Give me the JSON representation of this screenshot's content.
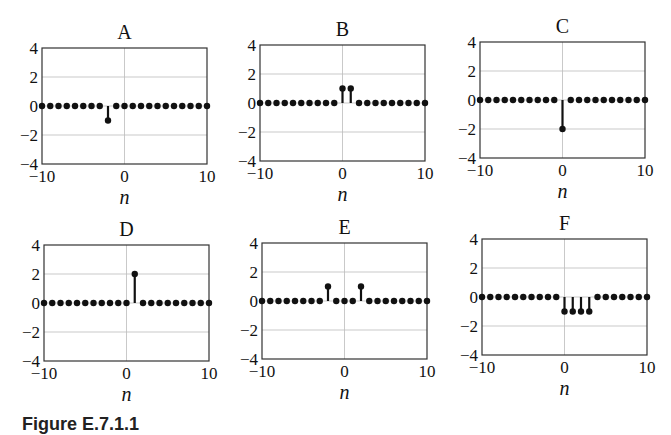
{
  "figure": {
    "caption": "Figure E.7.1.1"
  },
  "axes_common": {
    "xlim": [
      -10,
      10
    ],
    "ylim": [
      -4,
      4
    ],
    "xticks": [
      -10,
      0,
      10
    ],
    "xtick_labels": [
      "−10",
      "0",
      "10"
    ],
    "yticks": [
      4,
      2,
      0,
      -2,
      -4
    ],
    "ytick_labels": [
      "4",
      "2",
      "0",
      "−2",
      "−4"
    ],
    "xlabel": "n",
    "grid": true,
    "marker_color": "#111111",
    "grid_color": "#bbbbbb"
  },
  "chart_data": [
    {
      "type": "stem",
      "title": "A",
      "xlabel": "n",
      "ylabel": "",
      "xlim": [
        -10,
        10
      ],
      "ylim": [
        -4,
        4
      ],
      "grid": true,
      "x": [
        -10,
        -9,
        -8,
        -7,
        -6,
        -5,
        -4,
        -3,
        -2,
        -1,
        0,
        1,
        2,
        3,
        4,
        5,
        6,
        7,
        8,
        9,
        10
      ],
      "values": [
        0,
        0,
        0,
        0,
        0,
        0,
        0,
        0,
        -1,
        0,
        0,
        0,
        0,
        0,
        0,
        0,
        0,
        0,
        0,
        0,
        0
      ]
    },
    {
      "type": "stem",
      "title": "B",
      "xlabel": "n",
      "ylabel": "",
      "xlim": [
        -10,
        10
      ],
      "ylim": [
        -4,
        4
      ],
      "grid": true,
      "x": [
        -10,
        -9,
        -8,
        -7,
        -6,
        -5,
        -4,
        -3,
        -2,
        -1,
        0,
        1,
        2,
        3,
        4,
        5,
        6,
        7,
        8,
        9,
        10
      ],
      "values": [
        0,
        0,
        0,
        0,
        0,
        0,
        0,
        0,
        0,
        0,
        1,
        1,
        0,
        0,
        0,
        0,
        0,
        0,
        0,
        0,
        0
      ]
    },
    {
      "type": "stem",
      "title": "C",
      "xlabel": "n",
      "ylabel": "",
      "xlim": [
        -10,
        10
      ],
      "ylim": [
        -4,
        4
      ],
      "grid": true,
      "x": [
        -10,
        -9,
        -8,
        -7,
        -6,
        -5,
        -4,
        -3,
        -2,
        -1,
        0,
        1,
        2,
        3,
        4,
        5,
        6,
        7,
        8,
        9,
        10
      ],
      "values": [
        0,
        0,
        0,
        0,
        0,
        0,
        0,
        0,
        0,
        0,
        -2,
        0,
        0,
        0,
        0,
        0,
        0,
        0,
        0,
        0,
        0
      ]
    },
    {
      "type": "stem",
      "title": "D",
      "xlabel": "n",
      "ylabel": "",
      "xlim": [
        -10,
        10
      ],
      "ylim": [
        -4,
        4
      ],
      "grid": true,
      "x": [
        -10,
        -9,
        -8,
        -7,
        -6,
        -5,
        -4,
        -3,
        -2,
        -1,
        0,
        1,
        2,
        3,
        4,
        5,
        6,
        7,
        8,
        9,
        10
      ],
      "values": [
        0,
        0,
        0,
        0,
        0,
        0,
        0,
        0,
        0,
        0,
        0,
        2,
        0,
        0,
        0,
        0,
        0,
        0,
        0,
        0,
        0
      ]
    },
    {
      "type": "stem",
      "title": "E",
      "xlabel": "n",
      "ylabel": "",
      "xlim": [
        -10,
        10
      ],
      "ylim": [
        -4,
        4
      ],
      "grid": true,
      "x": [
        -10,
        -9,
        -8,
        -7,
        -6,
        -5,
        -4,
        -3,
        -2,
        -1,
        0,
        1,
        2,
        3,
        4,
        5,
        6,
        7,
        8,
        9,
        10
      ],
      "values": [
        0,
        0,
        0,
        0,
        0,
        0,
        0,
        0,
        1,
        0,
        0,
        0,
        1,
        0,
        0,
        0,
        0,
        0,
        0,
        0,
        0
      ]
    },
    {
      "type": "stem",
      "title": "F",
      "xlabel": "n",
      "ylabel": "",
      "xlim": [
        -10,
        10
      ],
      "ylim": [
        -4,
        4
      ],
      "grid": true,
      "x": [
        -10,
        -9,
        -8,
        -7,
        -6,
        -5,
        -4,
        -3,
        -2,
        -1,
        0,
        1,
        2,
        3,
        4,
        5,
        6,
        7,
        8,
        9,
        10
      ],
      "values": [
        0,
        0,
        0,
        0,
        0,
        0,
        0,
        0,
        0,
        0,
        -1,
        -1,
        -1,
        -1,
        0,
        0,
        0,
        0,
        0,
        0,
        0
      ]
    }
  ]
}
